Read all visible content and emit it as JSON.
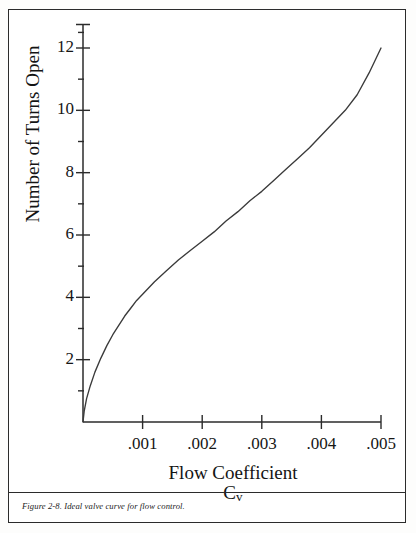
{
  "figure": {
    "caption": "Figure 2-8.  Ideal valve curve for flow control.",
    "frame_color": "#2b2b2b",
    "background_color": "#ffffff"
  },
  "chart_data": {
    "type": "line",
    "title": "",
    "subtitle": "",
    "xlabel": "Flow Coefficient",
    "xlabel_symbol": "C",
    "xlabel_symbol_subscript": "v",
    "ylabel": "Number of Turns Open",
    "xlim": [
      0,
      0.005
    ],
    "ylim": [
      0,
      12.7
    ],
    "grid": false,
    "legend": null,
    "line_color": "#3a3a3a",
    "axis_color": "#2b2b2b",
    "x_major_ticks": [
      0.001,
      0.002,
      0.003,
      0.004,
      0.005
    ],
    "x_major_tick_labels": [
      ".001",
      ".002",
      ".003",
      ".004",
      ".005"
    ],
    "x_minor_ticks": [],
    "y_major_ticks": [
      2,
      4,
      6,
      8,
      10,
      12
    ],
    "y_major_tick_labels": [
      "2",
      "4",
      "6",
      "8",
      "10",
      "12"
    ],
    "y_minor_ticks": [
      1,
      3,
      5,
      7,
      9,
      11,
      12.5
    ],
    "series": [
      {
        "name": "Ideal valve curve",
        "x": [
          0.0,
          2e-05,
          6e-05,
          0.00012,
          0.0002,
          0.0003,
          0.0004,
          0.0005,
          0.0006,
          0.0007,
          0.0008,
          0.0009,
          0.001,
          0.0012,
          0.0014,
          0.0016,
          0.0018,
          0.002,
          0.0022,
          0.0024,
          0.0026,
          0.0028,
          0.003,
          0.0032,
          0.0034,
          0.0036,
          0.0038,
          0.004,
          0.0042,
          0.0044,
          0.0046,
          0.0048,
          0.005
        ],
        "y": [
          0.0,
          0.35,
          0.75,
          1.15,
          1.6,
          2.05,
          2.45,
          2.8,
          3.1,
          3.4,
          3.65,
          3.9,
          4.1,
          4.5,
          4.85,
          5.2,
          5.5,
          5.8,
          6.1,
          6.45,
          6.75,
          7.1,
          7.4,
          7.75,
          8.1,
          8.45,
          8.8,
          9.2,
          9.6,
          10.0,
          10.5,
          11.2,
          12.0
        ]
      }
    ]
  },
  "geometry": {
    "origin_x": 83,
    "origin_y": 422,
    "x_end": 381,
    "y_top": 24
  }
}
